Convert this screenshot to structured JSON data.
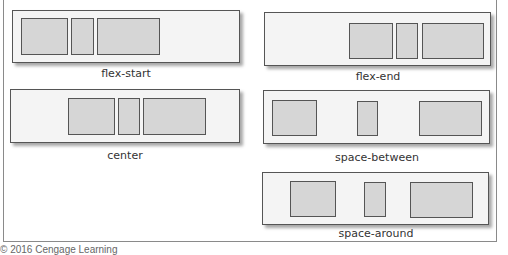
{
  "diagram": {
    "title": "",
    "panels": [
      {
        "id": "flex-start",
        "label": "flex-start"
      },
      {
        "id": "flex-end",
        "label": "flex-end"
      },
      {
        "id": "center",
        "label": "center"
      },
      {
        "id": "space-between",
        "label": "space-between"
      },
      {
        "id": "space-around",
        "label": "space-around"
      }
    ],
    "copyright": "© 2016 Cengage Learning"
  },
  "colors": {
    "panel_bg": "#f4f4f4",
    "item_bg": "#d6d6d6",
    "border": "#555555"
  }
}
